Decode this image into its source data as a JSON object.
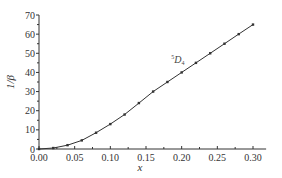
{
  "chart_data": {
    "type": "line",
    "title": "",
    "xlabel": "x",
    "ylabel": "1/β",
    "xlim": [
      0.0,
      0.31
    ],
    "ylim": [
      0,
      70
    ],
    "xticks": [
      0.0,
      0.05,
      0.1,
      0.15,
      0.2,
      0.25,
      0.3
    ],
    "xtick_labels": [
      "0.00",
      "0.05",
      "0.10",
      "0.15",
      "0.20",
      "0.25",
      "0.30"
    ],
    "yticks": [
      0,
      10,
      20,
      30,
      40,
      50,
      60,
      70
    ],
    "ytick_labels": [
      "0",
      "10",
      "20",
      "30",
      "40",
      "50",
      "60",
      "70"
    ],
    "grid": false,
    "legend": null,
    "annotations": [
      {
        "text": "5D4",
        "display": {
          "sup": "5",
          "main": "D",
          "sub": "4"
        },
        "x": 0.205,
        "y": 47
      }
    ],
    "series": [
      {
        "name": "5D4",
        "marker": "square",
        "color": "#333333",
        "x": [
          0.0,
          0.02,
          0.04,
          0.06,
          0.08,
          0.1,
          0.12,
          0.14,
          0.16,
          0.18,
          0.2,
          0.22,
          0.24,
          0.26,
          0.28,
          0.3
        ],
        "y": [
          0,
          0.5,
          2,
          4.5,
          8.5,
          13,
          18,
          24,
          30,
          35,
          40,
          45,
          50,
          55,
          60,
          65
        ]
      }
    ]
  },
  "labels": {
    "xlabel": "x",
    "ylabel": "1/β",
    "annotation_sup": "5",
    "annotation_main": "D",
    "annotation_sub": "4"
  }
}
